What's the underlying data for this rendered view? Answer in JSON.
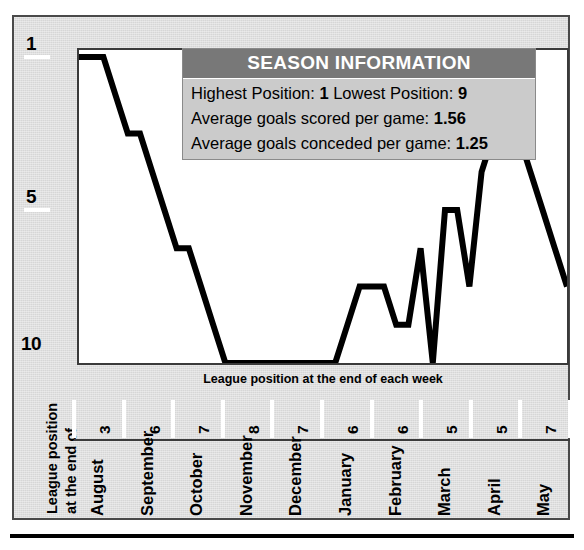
{
  "panel": {
    "title": "League Position Chart"
  },
  "info": {
    "header": "SEASON INFORMATION",
    "rows": [
      {
        "label": "Highest Position:",
        "value": "1",
        "label2": "Lowest Position:",
        "value2": "9"
      },
      {
        "label": "Average goals scored per game:",
        "value": "1.56"
      },
      {
        "label": "Average goals conceded per game:",
        "value": "1.25"
      }
    ],
    "row1_text": "Highest Position: ",
    "row1_v1": "1",
    "row1_mid": " Lowest Position: ",
    "row1_v2": "9",
    "row2_text": "Average goals scored per game: ",
    "row2_v": "1.56",
    "row3_text": "Average goals conceded per game: ",
    "row3_v": "1.25"
  },
  "axis": {
    "x_caption": "League position at the end of each week",
    "y_title_line1": "League position",
    "y_title_line2": "at the end of",
    "y_ticks": [
      "1",
      "5",
      "10"
    ]
  },
  "months": [
    {
      "name": "August",
      "num": "3"
    },
    {
      "name": "September",
      "num": "6"
    },
    {
      "name": "October",
      "num": "7"
    },
    {
      "name": "November",
      "num": "8"
    },
    {
      "name": "December",
      "num": "7"
    },
    {
      "name": "January",
      "num": "6"
    },
    {
      "name": "February",
      "num": "6"
    },
    {
      "name": "March",
      "num": "5"
    },
    {
      "name": "April",
      "num": "5"
    },
    {
      "name": "May",
      "num": "7"
    }
  ],
  "colors": {
    "panel_bg": "#d6d6d6",
    "plot_bg": "#ffffff",
    "line": "#000000",
    "header_bar": "#787878",
    "info_bg": "#cbcbcb",
    "frame": "#4a4a4a"
  },
  "chart_data": {
    "type": "line",
    "title": "League position at the end of each week",
    "xlabel": "League position at the end of each week",
    "ylabel": "League position",
    "ylim": [
      1,
      10
    ],
    "y_inverted": true,
    "grid": false,
    "legend": null,
    "x_tick_labels": [
      "August",
      "September",
      "October",
      "November",
      "December",
      "January",
      "February",
      "March",
      "April",
      "May"
    ],
    "x_tick_values": [
      "3",
      "6",
      "7",
      "8",
      "7",
      "6",
      "6",
      "5",
      "5",
      "7"
    ],
    "y_tick_labels": [
      "1",
      "5",
      "10"
    ],
    "series": [
      {
        "name": "League position",
        "x": [
          0,
          1,
          2,
          3,
          4,
          5,
          6,
          7,
          8,
          9,
          10,
          11,
          12,
          13,
          14,
          15,
          16,
          17,
          18,
          19,
          20,
          21,
          22,
          23,
          24,
          25,
          26,
          27,
          28,
          29,
          30,
          31,
          32,
          33,
          34,
          35,
          36,
          37,
          38,
          39,
          40
        ],
        "values": [
          1,
          1,
          1,
          2,
          3,
          3,
          4,
          5,
          6,
          6,
          7,
          8,
          9,
          9,
          9,
          9,
          9,
          9,
          9,
          9,
          9,
          9,
          8,
          7,
          7,
          7,
          8,
          8,
          6,
          9,
          5,
          5,
          7,
          4,
          3,
          3,
          3,
          4,
          5,
          6,
          7
        ]
      }
    ],
    "annotations": [
      "Highest Position: 1",
      "Lowest Position: 9",
      "Average goals scored per game: 1.56",
      "Average goals conceded per game: 1.25"
    ]
  }
}
